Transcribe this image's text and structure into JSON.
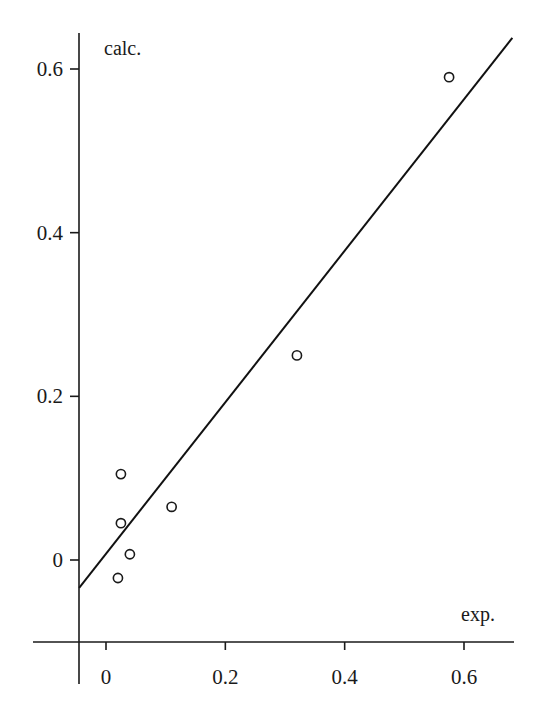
{
  "chart_data": {
    "type": "scatter",
    "title": "",
    "xlabel": "exp.",
    "ylabel": "calc.",
    "xlim": [
      -0.045,
      0.685
    ],
    "ylim": [
      -0.1,
      0.64
    ],
    "grid": false,
    "legend": null,
    "x_ticks": [
      0,
      0.2,
      0.4,
      0.6
    ],
    "x_tick_labels": [
      "0",
      "0.2",
      "0.4",
      "0.6"
    ],
    "y_ticks": [
      0,
      0.2,
      0.4,
      0.6
    ],
    "y_tick_labels": [
      "0",
      "0.2",
      "0.4",
      "0.6"
    ],
    "series": [
      {
        "name": "data points",
        "marker": "open-circle",
        "points": [
          {
            "x": 0.025,
            "y": 0.105
          },
          {
            "x": 0.11,
            "y": 0.065
          },
          {
            "x": 0.025,
            "y": 0.045
          },
          {
            "x": 0.04,
            "y": 0.007
          },
          {
            "x": 0.02,
            "y": -0.022
          },
          {
            "x": 0.32,
            "y": 0.25
          },
          {
            "x": 0.575,
            "y": 0.59
          }
        ]
      },
      {
        "name": "fit line",
        "type": "line",
        "points": [
          {
            "x": -0.045,
            "y": -0.034
          },
          {
            "x": 0.681,
            "y": 0.638
          }
        ]
      }
    ]
  },
  "labels": {
    "x_axis_title": "exp.",
    "y_axis_title": "calc."
  },
  "colors": {
    "ink": "#1a1a1a",
    "background": "#ffffff"
  }
}
